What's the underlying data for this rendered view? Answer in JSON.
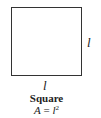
{
  "figure": {
    "shape": "square",
    "side_label_right": "l",
    "side_label_bottom": "l",
    "title": "Square",
    "formula": {
      "lhs": "A",
      "equals": " = ",
      "base": "l",
      "exponent": "2"
    }
  }
}
